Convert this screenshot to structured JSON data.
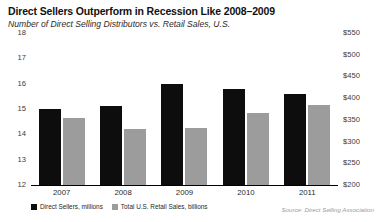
{
  "chart_data": {
    "type": "bar",
    "title": "Direct Sellers Outperform in Recession Like 2008–2009",
    "subtitle": "Number of Direct Selling Distributors vs. Retail Sales, U.S.",
    "categories": [
      "2007",
      "2008",
      "2009",
      "2010",
      "2011"
    ],
    "series": [
      {
        "name": "Direct Sellers, millions",
        "axis": "left",
        "color": "#0d0d0d",
        "values": [
          15.0,
          15.1,
          16.0,
          15.8,
          15.6
        ]
      },
      {
        "name": "Total U.S. Retail Sales, billions",
        "axis": "right",
        "color": "#9c9c9c",
        "values": [
          355,
          330,
          332,
          365,
          385
        ]
      }
    ],
    "ylabel": "",
    "xlabel": "",
    "ylim": [
      12,
      18
    ],
    "y2lim": [
      200,
      550
    ],
    "left_ticks": [
      "18",
      "17",
      "16",
      "15",
      "14",
      "13",
      "12"
    ],
    "left_tick_values": [
      18,
      17,
      16,
      15,
      14,
      13,
      12
    ],
    "right_ticks": [
      "$550",
      "$500",
      "$450",
      "$400",
      "$350",
      "$300",
      "$250",
      "$200"
    ],
    "right_tick_values": [
      550,
      500,
      450,
      400,
      350,
      300,
      250,
      200
    ],
    "grid": false,
    "legend_position": "bottom-left",
    "source": "Source: Direct Selling Association"
  },
  "legend": {
    "items": [
      {
        "label": "Direct Sellers, millions"
      },
      {
        "label": "Total U.S. Retail Sales, billions"
      }
    ]
  }
}
